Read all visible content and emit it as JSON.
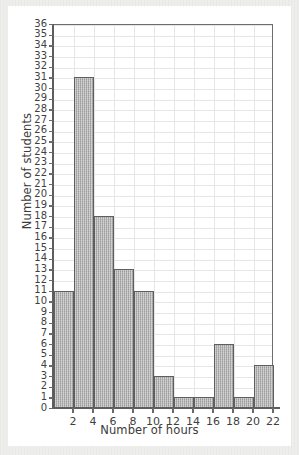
{
  "chart_data": {
    "type": "bar",
    "title": "",
    "subtitle": "",
    "xlabel": "Number of hours",
    "ylabel": "Number of students",
    "bin_edges": [
      0,
      2,
      4,
      6,
      8,
      10,
      12,
      14,
      16,
      18,
      20,
      22
    ],
    "categories": [
      "0-2",
      "2-4",
      "4-6",
      "6-8",
      "8-10",
      "10-12",
      "12-14",
      "14-16",
      "16-18",
      "18-20",
      "20-22"
    ],
    "values": [
      11,
      31,
      18,
      13,
      11,
      3,
      1,
      1,
      6,
      1,
      4
    ],
    "xlim": [
      0,
      22
    ],
    "ylim": [
      0,
      36
    ],
    "xticks": [
      2,
      4,
      6,
      8,
      10,
      12,
      14,
      16,
      18,
      20,
      22
    ],
    "xtick_labels": [
      "2",
      "4",
      "6",
      "8",
      "10",
      "12",
      "14",
      "16",
      "18",
      "20",
      "22"
    ],
    "yticks": [
      0,
      1,
      2,
      3,
      4,
      5,
      6,
      7,
      8,
      9,
      10,
      11,
      12,
      13,
      14,
      15,
      16,
      17,
      18,
      19,
      20,
      21,
      22,
      23,
      24,
      25,
      26,
      27,
      28,
      29,
      30,
      31,
      32,
      33,
      34,
      35,
      36
    ],
    "ytick_labels": [
      "0",
      "1",
      "2",
      "3",
      "4",
      "5",
      "6",
      "7",
      "8",
      "9",
      "10",
      "11",
      "12",
      "13",
      "14",
      "15",
      "16",
      "17",
      "18",
      "19",
      "20",
      "21",
      "22",
      "23",
      "24",
      "25",
      "26",
      "27",
      "28",
      "29",
      "30",
      "31",
      "32",
      "33",
      "34",
      "35",
      "36"
    ],
    "grid": true,
    "legend": null,
    "legend_position": "none",
    "bar_fill_color": "#a9a9a9",
    "bar_edge_color": "#5e5e5e",
    "grid_color": "#e6e6e6",
    "axis_color": "#5d5d5d",
    "plot_background": "#ffffff",
    "page_background": "#eeeeed"
  }
}
